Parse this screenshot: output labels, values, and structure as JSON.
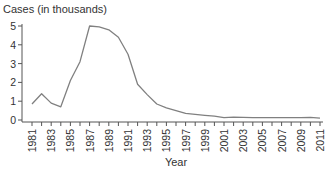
{
  "chart_data": {
    "type": "line",
    "title": "Cases (in thousands)",
    "xlabel": "Year",
    "ylabel": "",
    "xlim": [
      1981,
      2011
    ],
    "ylim": [
      0,
      5
    ],
    "yticks": [
      0,
      1,
      2,
      3,
      4,
      5
    ],
    "xtick_labels": [
      "1981",
      "1983",
      "1985",
      "1987",
      "1989",
      "1991",
      "1993",
      "1995",
      "1997",
      "1999",
      "2001",
      "2003",
      "2005",
      "2007",
      "2009",
      "2011"
    ],
    "minor_xticks_every_year": true,
    "grid": false,
    "series": [
      {
        "name": "Cases",
        "color": "#808080",
        "x": [
          1981,
          1982,
          1983,
          1984,
          1985,
          1986,
          1987,
          1988,
          1989,
          1990,
          1991,
          1992,
          1993,
          1994,
          1995,
          1996,
          1997,
          1998,
          1999,
          2000,
          2001,
          2002,
          2003,
          2004,
          2005,
          2006,
          2007,
          2008,
          2009,
          2010,
          2011
        ],
        "values": [
          0.85,
          1.4,
          0.9,
          0.7,
          2.1,
          3.1,
          5.0,
          4.95,
          4.8,
          4.4,
          3.5,
          1.9,
          1.35,
          0.85,
          0.65,
          0.5,
          0.35,
          0.3,
          0.25,
          0.2,
          0.12,
          0.15,
          0.14,
          0.13,
          0.12,
          0.12,
          0.12,
          0.12,
          0.13,
          0.14,
          0.1
        ]
      }
    ]
  }
}
